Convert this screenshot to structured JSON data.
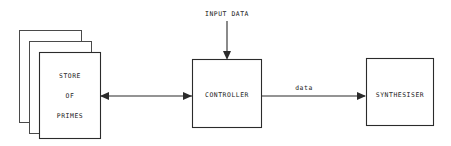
{
  "diagram": {
    "type": "block-diagram",
    "background_color": "#ffffff",
    "stroke_color": "#2b2b2b",
    "text_color": "#1a1a1a",
    "nodes": [
      {
        "id": "store-of-primes",
        "shape": "stacked-rectangle",
        "stack_count": 3,
        "label_lines": [
          "STORE",
          "OF",
          "PRIMES"
        ],
        "line1": "STORE",
        "line2": "OF",
        "line3": "PRIMES"
      },
      {
        "id": "controller",
        "shape": "rectangle",
        "label": "CONTROLLER"
      },
      {
        "id": "synthesiser",
        "shape": "rectangle",
        "label": "SYNTHESISER"
      }
    ],
    "edges": [
      {
        "id": "input-data-edge",
        "label": "INPUT DATA",
        "from": "external-input",
        "to": "controller",
        "direction": "down",
        "arrowheads": "single"
      },
      {
        "id": "store-controller-edge",
        "label": "",
        "from": "store-of-primes",
        "to": "controller",
        "direction": "horizontal",
        "arrowheads": "double"
      },
      {
        "id": "controller-synthesiser-edge",
        "label": "data",
        "from": "controller",
        "to": "synthesiser",
        "direction": "right",
        "arrowheads": "single"
      }
    ]
  }
}
